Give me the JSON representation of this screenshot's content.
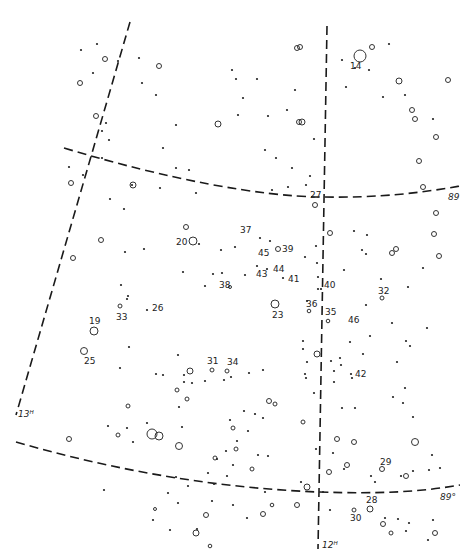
{
  "map": {
    "type": "star-chart",
    "grid_labels": [
      {
        "id": "ra-13h",
        "text": "13ᴴ",
        "x": 18,
        "y": 417
      },
      {
        "id": "ra-12h",
        "text": "12ᴴ",
        "x": 322,
        "y": 548
      },
      {
        "id": "dec-89-top",
        "text": "89",
        "x": 448,
        "y": 200
      },
      {
        "id": "dec-89-bottom",
        "text": "89°",
        "x": 440,
        "y": 500
      }
    ],
    "star_labels": [
      {
        "text": "14",
        "x": 350,
        "y": 69
      },
      {
        "text": "27",
        "x": 310,
        "y": 198
      },
      {
        "text": "37",
        "x": 240,
        "y": 233
      },
      {
        "text": "20",
        "x": 176,
        "y": 245
      },
      {
        "text": "45",
        "x": 258,
        "y": 256
      },
      {
        "text": "39",
        "x": 282,
        "y": 252
      },
      {
        "text": "44",
        "x": 273,
        "y": 272
      },
      {
        "text": "43",
        "x": 256,
        "y": 277
      },
      {
        "text": "41",
        "x": 288,
        "y": 282
      },
      {
        "text": "38",
        "x": 219,
        "y": 288
      },
      {
        "text": "40",
        "x": 324,
        "y": 288
      },
      {
        "text": "32",
        "x": 378,
        "y": 294
      },
      {
        "text": "36",
        "x": 306,
        "y": 307
      },
      {
        "text": "26",
        "x": 152,
        "y": 311
      },
      {
        "text": "33",
        "x": 116,
        "y": 320
      },
      {
        "text": "23",
        "x": 272,
        "y": 318
      },
      {
        "text": "35",
        "x": 325,
        "y": 315
      },
      {
        "text": "19",
        "x": 89,
        "y": 324
      },
      {
        "text": "46",
        "x": 348,
        "y": 323
      },
      {
        "text": "25",
        "x": 84,
        "y": 364
      },
      {
        "text": "31",
        "x": 207,
        "y": 364
      },
      {
        "text": "34",
        "x": 227,
        "y": 365
      },
      {
        "text": "42",
        "x": 355,
        "y": 377
      },
      {
        "text": "29",
        "x": 380,
        "y": 465
      },
      {
        "text": "28",
        "x": 366,
        "y": 503
      },
      {
        "text": "30",
        "x": 350,
        "y": 521
      }
    ],
    "stars_ring": [
      [
        360,
        56,
        6
      ],
      [
        372,
        47,
        2.5
      ],
      [
        399,
        81,
        3
      ],
      [
        448,
        80,
        2.5
      ],
      [
        412,
        110,
        2.5
      ],
      [
        415,
        119,
        2.5
      ],
      [
        436,
        137,
        2.5
      ],
      [
        423,
        187,
        2.5
      ],
      [
        419,
        161,
        2.5
      ],
      [
        302,
        122,
        3
      ],
      [
        300,
        47,
        2.5
      ],
      [
        297,
        48,
        2.5
      ],
      [
        159,
        66,
        2.5
      ],
      [
        105,
        59,
        2.5
      ],
      [
        80,
        83,
        2.5
      ],
      [
        96,
        116,
        2.5
      ],
      [
        133,
        185,
        3
      ],
      [
        71,
        183,
        2.5
      ],
      [
        218,
        124,
        3
      ],
      [
        299,
        122,
        2.5
      ],
      [
        193,
        241,
        4
      ],
      [
        186,
        227,
        2.5
      ],
      [
        278,
        249,
        2.5
      ],
      [
        230,
        287,
        1.5
      ],
      [
        275,
        304,
        4
      ],
      [
        309,
        311,
        1.8
      ],
      [
        328,
        321,
        1.8
      ],
      [
        120,
        306,
        2
      ],
      [
        94,
        331,
        4
      ],
      [
        84,
        351,
        3.5
      ],
      [
        73,
        258,
        2.5
      ],
      [
        101,
        240,
        2.5
      ],
      [
        315,
        205,
        2.5
      ],
      [
        330,
        233,
        2.5
      ],
      [
        392,
        253,
        2.5
      ],
      [
        396,
        249,
        2.5
      ],
      [
        439,
        256,
        2.5
      ],
      [
        434,
        234,
        2.5
      ],
      [
        436,
        213,
        2.5
      ],
      [
        382,
        298,
        2
      ],
      [
        190,
        371,
        3
      ],
      [
        212,
        370,
        2
      ],
      [
        227,
        371,
        2
      ],
      [
        317,
        354,
        3
      ],
      [
        177,
        390,
        2
      ],
      [
        187,
        399,
        2
      ],
      [
        269,
        401,
        2.5
      ],
      [
        275,
        404,
        2
      ],
      [
        152,
        434,
        5
      ],
      [
        159,
        436,
        4
      ],
      [
        179,
        446,
        3.5
      ],
      [
        128,
        406,
        2
      ],
      [
        118,
        435,
        2
      ],
      [
        69,
        439,
        2.5
      ],
      [
        233,
        428,
        2
      ],
      [
        236,
        449,
        2
      ],
      [
        215,
        458,
        2
      ],
      [
        303,
        422,
        2
      ],
      [
        337,
        439,
        2.5
      ],
      [
        354,
        442,
        2.5
      ],
      [
        347,
        465,
        2.5
      ],
      [
        415,
        442,
        3.5
      ],
      [
        382,
        469,
        2.5
      ],
      [
        406,
        476,
        2.5
      ],
      [
        307,
        487,
        3
      ],
      [
        263,
        514,
        2.5
      ],
      [
        252,
        469,
        2
      ],
      [
        272,
        505,
        1.8
      ],
      [
        297,
        505,
        2.5
      ],
      [
        329,
        472,
        2.5
      ],
      [
        354,
        510,
        2
      ],
      [
        370,
        509,
        3
      ],
      [
        383,
        524,
        2.5
      ],
      [
        391,
        533,
        2
      ],
      [
        435,
        533,
        2.5
      ],
      [
        206,
        515,
        2.5
      ],
      [
        196,
        533,
        3
      ],
      [
        210,
        546,
        1.8
      ],
      [
        155,
        509,
        1.5
      ]
    ],
    "stars_dot": [
      [
        389,
        44
      ],
      [
        355,
        68
      ],
      [
        342,
        60
      ],
      [
        369,
        70
      ],
      [
        405,
        95
      ],
      [
        383,
        97
      ],
      [
        346,
        87
      ],
      [
        433,
        119
      ],
      [
        295,
        90
      ],
      [
        257,
        79
      ],
      [
        232,
        70
      ],
      [
        287,
        110
      ],
      [
        268,
        116
      ],
      [
        314,
        139
      ],
      [
        276,
        158
      ],
      [
        292,
        168
      ],
      [
        310,
        176
      ],
      [
        306,
        185
      ],
      [
        81,
        50
      ],
      [
        97,
        44
      ],
      [
        93,
        73
      ],
      [
        139,
        58
      ],
      [
        142,
        83
      ],
      [
        118,
        61
      ],
      [
        156,
        95
      ],
      [
        176,
        125
      ],
      [
        236,
        79
      ],
      [
        243,
        98
      ],
      [
        238,
        115
      ],
      [
        265,
        150
      ],
      [
        288,
        187
      ],
      [
        272,
        190
      ],
      [
        102,
        158
      ],
      [
        132,
        185
      ],
      [
        83,
        175
      ],
      [
        69,
        167
      ],
      [
        110,
        199
      ],
      [
        160,
        188
      ],
      [
        196,
        193
      ],
      [
        189,
        170
      ],
      [
        163,
        148
      ],
      [
        176,
        168
      ],
      [
        109,
        140
      ],
      [
        102,
        131
      ],
      [
        106,
        123
      ],
      [
        199,
        244
      ],
      [
        235,
        247
      ],
      [
        260,
        238
      ],
      [
        270,
        241
      ],
      [
        316,
        246
      ],
      [
        305,
        257
      ],
      [
        317,
        263
      ],
      [
        318,
        277
      ],
      [
        362,
        250
      ],
      [
        366,
        254
      ],
      [
        381,
        279
      ],
      [
        344,
        270
      ],
      [
        408,
        287
      ],
      [
        423,
        268
      ],
      [
        367,
        235
      ],
      [
        354,
        231
      ],
      [
        124,
        209
      ],
      [
        144,
        249
      ],
      [
        125,
        252
      ],
      [
        183,
        272
      ],
      [
        213,
        274
      ],
      [
        221,
        250
      ],
      [
        245,
        275
      ],
      [
        222,
        273
      ],
      [
        205,
        286
      ],
      [
        257,
        266
      ],
      [
        267,
        269
      ],
      [
        283,
        278
      ],
      [
        318,
        289
      ],
      [
        321,
        289
      ],
      [
        307,
        301
      ],
      [
        366,
        305
      ],
      [
        121,
        285
      ],
      [
        128,
        296
      ],
      [
        147,
        310
      ],
      [
        127,
        299
      ],
      [
        129,
        347
      ],
      [
        120,
        368
      ],
      [
        184,
        375
      ],
      [
        192,
        383
      ],
      [
        205,
        381
      ],
      [
        184,
        382
      ],
      [
        156,
        374
      ],
      [
        163,
        375
      ],
      [
        178,
        355
      ],
      [
        231,
        377
      ],
      [
        249,
        373
      ],
      [
        263,
        370
      ],
      [
        305,
        374
      ],
      [
        306,
        378
      ],
      [
        331,
        361
      ],
      [
        340,
        358
      ],
      [
        334,
        371
      ],
      [
        351,
        374
      ],
      [
        363,
        354
      ],
      [
        352,
        378
      ],
      [
        370,
        336
      ],
      [
        392,
        323
      ],
      [
        406,
        341
      ],
      [
        410,
        346
      ],
      [
        427,
        328
      ],
      [
        350,
        342
      ],
      [
        341,
        365
      ],
      [
        334,
        382
      ],
      [
        393,
        397
      ],
      [
        403,
        403
      ],
      [
        413,
        417
      ],
      [
        405,
        388
      ],
      [
        397,
        362
      ],
      [
        342,
        408
      ],
      [
        355,
        408
      ],
      [
        314,
        393
      ],
      [
        307,
        362
      ],
      [
        303,
        349
      ],
      [
        303,
        341
      ],
      [
        108,
        426
      ],
      [
        127,
        428
      ],
      [
        133,
        442
      ],
      [
        147,
        423
      ],
      [
        179,
        407
      ],
      [
        182,
        427
      ],
      [
        237,
        441
      ],
      [
        248,
        431
      ],
      [
        244,
        411
      ],
      [
        255,
        414
      ],
      [
        258,
        455
      ],
      [
        268,
        456
      ],
      [
        233,
        465
      ],
      [
        227,
        476
      ],
      [
        208,
        473
      ],
      [
        214,
        484
      ],
      [
        226,
        451
      ],
      [
        104,
        490
      ],
      [
        168,
        493
      ],
      [
        176,
        477
      ],
      [
        188,
        486
      ],
      [
        178,
        503
      ],
      [
        217,
        459
      ],
      [
        230,
        420
      ],
      [
        224,
        380
      ],
      [
        263,
        418
      ],
      [
        301,
        482
      ],
      [
        265,
        492
      ],
      [
        344,
        469
      ],
      [
        333,
        453
      ],
      [
        316,
        449
      ],
      [
        371,
        476
      ],
      [
        401,
        476
      ],
      [
        413,
        471
      ],
      [
        440,
        468
      ],
      [
        432,
        455
      ],
      [
        429,
        470
      ],
      [
        375,
        482
      ],
      [
        385,
        518
      ],
      [
        398,
        519
      ],
      [
        409,
        523
      ],
      [
        406,
        531
      ],
      [
        428,
        540
      ],
      [
        433,
        520
      ],
      [
        153,
        520
      ],
      [
        170,
        530
      ],
      [
        197,
        529
      ],
      [
        233,
        505
      ],
      [
        247,
        518
      ],
      [
        212,
        501
      ],
      [
        323,
        492
      ],
      [
        330,
        510
      ]
    ],
    "grid_lines": {
      "ra_13h": "M 130 22 L 16 415",
      "ra_12h": "M 327 26 L 318 549",
      "dec_89_top": "M 64 148 C 170 180, 260 196, 320 197 C 380 198, 420 193, 460 186",
      "dec_89_bottom": "M 16 442 C 120 472, 220 488, 318 492 C 380 494, 420 492, 460 485"
    },
    "colors": {
      "background": "#ffffff",
      "ink": "#1a1a1a"
    }
  }
}
